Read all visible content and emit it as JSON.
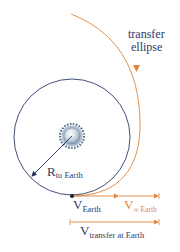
{
  "labels": {
    "transfer_line1": "transfer",
    "transfer_line2": "ellipse",
    "radius_main": "R",
    "radius_sub": "to Earth",
    "v_earth_main": "V",
    "v_earth_sub": "Earth",
    "v_inf_main": "V",
    "v_inf_sub": "∞ Earth",
    "v_transfer_main": "V",
    "v_transfer_sub": "transfer at Earth"
  },
  "colors": {
    "orbit": "#2b3a67",
    "transfer": "#e0853a",
    "text_dark": "#2b3a67",
    "text_orange": "#e0853a"
  }
}
